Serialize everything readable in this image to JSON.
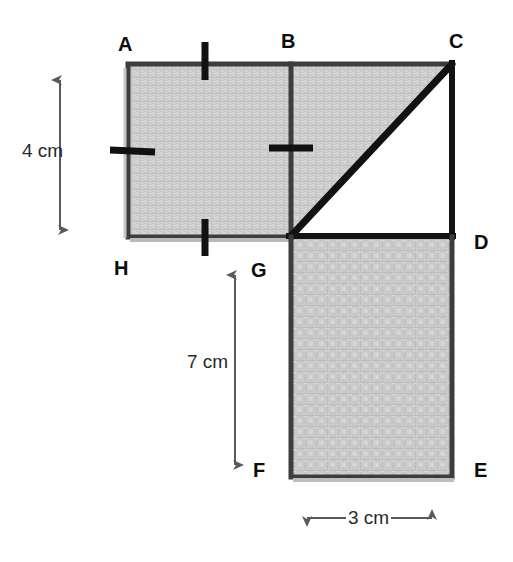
{
  "figure": {
    "vertex_labels": [
      {
        "name": "A",
        "text": "A",
        "x": 118,
        "y": 34
      },
      {
        "name": "B",
        "text": "B",
        "x": 281,
        "y": 31
      },
      {
        "name": "C",
        "text": "C",
        "x": 449,
        "y": 31
      },
      {
        "name": "D",
        "text": "D",
        "x": 474,
        "y": 232
      },
      {
        "name": "E",
        "text": "E",
        "x": 474,
        "y": 460
      },
      {
        "name": "F",
        "text": "F",
        "x": 253,
        "y": 460
      },
      {
        "name": "G",
        "text": "G",
        "x": 251,
        "y": 260
      },
      {
        "name": "H",
        "text": "H",
        "x": 114,
        "y": 258
      }
    ],
    "dimension_labels": [
      {
        "name": "height-4cm",
        "text": "4 cm",
        "x": 22,
        "y": 141
      },
      {
        "name": "height-7cm",
        "text": "7 cm",
        "x": 187,
        "y": 352
      },
      {
        "name": "width-3cm",
        "text": "3 cm",
        "x": 346,
        "y": 508
      }
    ],
    "colors": {
      "shading": "#c9c9c9",
      "shading_light": "#d6d6d6",
      "shading_dark": "#bcbcbc",
      "outline_dark": "#151515",
      "outline_gray": "#4a4a4a",
      "arrow": "#5a5a5a",
      "label": "#0d0d0d",
      "background": "#ffffff"
    },
    "geometry": {
      "top_rect": {
        "x": 128,
        "y": 64,
        "width": 324,
        "height": 173
      },
      "divider_x": 291,
      "bottom_rect": {
        "x": 291,
        "y": 237,
        "width": 161,
        "height": 240
      },
      "triangle_white": [
        [
          291,
          236
        ],
        [
          452,
          63
        ],
        [
          452,
          236
        ]
      ],
      "hypotenuse": {
        "x1": 291,
        "y1": 236,
        "x2": 452,
        "y2": 63
      }
    },
    "tick_marks": [
      {
        "name": "tick-ab-top",
        "orientation": "vertical",
        "x": 205,
        "y1": 42,
        "y2": 80
      },
      {
        "name": "tick-hg-bottom",
        "orientation": "vertical",
        "x": 205,
        "y1": 219,
        "y2": 256
      },
      {
        "name": "tick-ah-left",
        "orientation": "horizontal",
        "y": 150,
        "x1": 110,
        "x2": 155
      },
      {
        "name": "tick-bg-right",
        "orientation": "horizontal",
        "y": 148,
        "x1": 269,
        "x2": 313
      }
    ],
    "arrows": [
      {
        "name": "arrow-4cm",
        "orientation": "vertical",
        "x": 60,
        "y1": 70,
        "y2": 238
      },
      {
        "name": "arrow-7cm",
        "orientation": "vertical",
        "x": 235,
        "y1": 264,
        "y2": 474
      },
      {
        "name": "arrow-3cm",
        "orientation": "horizontal",
        "y": 518,
        "x1": 296,
        "x2": 443
      }
    ]
  }
}
